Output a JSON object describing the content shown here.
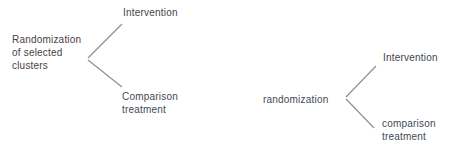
{
  "diagram": {
    "title_hint": "Two-stage cluster randomization tree",
    "root": {
      "label": "Randomization\nof selected\nclusters"
    },
    "level1": [
      {
        "label": "Intervention"
      },
      {
        "label": "Comparison\ntreatment"
      }
    ],
    "connector": {
      "label": "randomization"
    },
    "level2": [
      {
        "label": "Intervention"
      },
      {
        "label": "comparison\ntreatment"
      }
    ],
    "colors": {
      "branch_line": "#8c8c8c",
      "connector_line_green": "#a5d8ad",
      "connector_line_green_dark": "#84a08a",
      "text_primary": "#3f444c",
      "text_root": "#4a4244",
      "background": "#ffffff"
    }
  }
}
